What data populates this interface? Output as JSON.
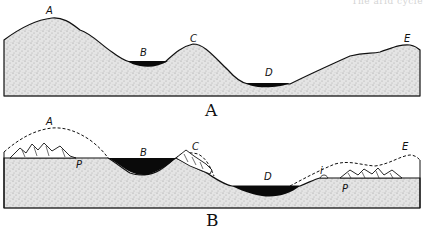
{
  "header": {
    "running_title": "The arid cycle"
  },
  "figure_a": {
    "caption": "A",
    "points": {
      "a": "A",
      "b": "B",
      "c": "C",
      "d": "D",
      "e": "E"
    }
  },
  "figure_b": {
    "caption": "B",
    "points": {
      "a": "A",
      "b": "B",
      "c": "C",
      "d": "D",
      "e": "E",
      "p1": "P",
      "p2": "P",
      "i": "i"
    }
  },
  "colors": {
    "ink": "#111111",
    "stipple": "#dcdcdc",
    "water": "#0a0a0a"
  }
}
